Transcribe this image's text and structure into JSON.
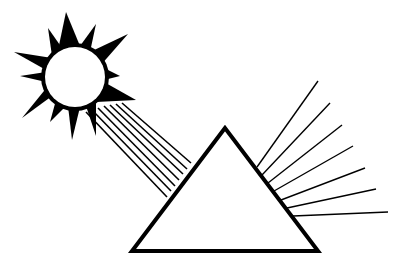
{
  "diagram": {
    "colors": {
      "background": "#ffffff",
      "stroke": "#000000",
      "fill": "#000000"
    },
    "sun": {
      "center": [
        75,
        77
      ],
      "radius": 30,
      "spikes": [
        [
          [
            58,
            50
          ],
          [
            66,
            12
          ],
          [
            80,
            46
          ]
        ],
        [
          [
            80,
            46
          ],
          [
            96,
            24
          ],
          [
            90,
            52
          ]
        ],
        [
          [
            90,
            52
          ],
          [
            128,
            34
          ],
          [
            100,
            66
          ]
        ],
        [
          [
            100,
            66
          ],
          [
            120,
            76
          ],
          [
            104,
            80
          ]
        ],
        [
          [
            104,
            82
          ],
          [
            136,
            100
          ],
          [
            96,
            102
          ]
        ],
        [
          [
            96,
            102
          ],
          [
            96,
            136
          ],
          [
            86,
            106
          ]
        ],
        [
          [
            80,
            107
          ],
          [
            72,
            140
          ],
          [
            68,
            106
          ]
        ],
        [
          [
            66,
            106
          ],
          [
            50,
            122
          ],
          [
            56,
            100
          ]
        ],
        [
          [
            52,
            96
          ],
          [
            22,
            118
          ],
          [
            48,
            86
          ]
        ],
        [
          [
            46,
            82
          ],
          [
            20,
            76
          ],
          [
            46,
            72
          ]
        ],
        [
          [
            46,
            70
          ],
          [
            14,
            52
          ],
          [
            52,
            58
          ]
        ],
        [
          [
            52,
            56
          ],
          [
            48,
            28
          ],
          [
            62,
            48
          ]
        ]
      ]
    },
    "incoming_rays": [
      {
        "from": [
          86,
          112
        ],
        "to": [
          167,
          197
        ]
      },
      {
        "from": [
          92,
          110
        ],
        "to": [
          171,
          191
        ]
      },
      {
        "from": [
          98,
          108
        ],
        "to": [
          175,
          186
        ]
      },
      {
        "from": [
          104,
          106
        ],
        "to": [
          179,
          180
        ]
      },
      {
        "from": [
          110,
          105
        ],
        "to": [
          183,
          174
        ]
      },
      {
        "from": [
          116,
          104
        ],
        "to": [
          187,
          169
        ]
      },
      {
        "from": [
          122,
          103
        ],
        "to": [
          191,
          163
        ]
      }
    ],
    "prism": {
      "points": [
        [
          225,
          128
        ],
        [
          132,
          251
        ],
        [
          318,
          251
        ]
      ],
      "stroke_width": 4
    },
    "outgoing_rays": [
      {
        "from": [
          257,
          167
        ],
        "to": [
          318,
          81
        ]
      },
      {
        "from": [
          262,
          175
        ],
        "to": [
          330,
          103
        ]
      },
      {
        "from": [
          268,
          183
        ],
        "to": [
          342,
          125
        ]
      },
      {
        "from": [
          274,
          191
        ],
        "to": [
          353,
          146
        ]
      },
      {
        "from": [
          281,
          200
        ],
        "to": [
          365,
          168
        ]
      },
      {
        "from": [
          287,
          208
        ],
        "to": [
          376,
          189
        ]
      },
      {
        "from": [
          293,
          216
        ],
        "to": [
          388,
          212
        ]
      }
    ]
  }
}
